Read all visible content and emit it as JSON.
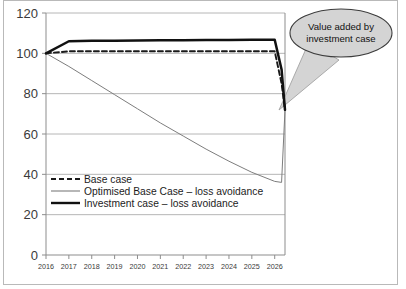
{
  "figure": {
    "frame_color": "#b9b9b9",
    "background": "#ffffff"
  },
  "callout": {
    "name": "value-added-callout",
    "line1": "Value added by",
    "line2": "investment case",
    "fill": "#d4d4d4",
    "stroke": "#3c3c3c"
  },
  "chart_data": {
    "type": "line",
    "title": "",
    "xlabel": "",
    "ylabel": "",
    "xlim": [
      2016,
      2026.45
    ],
    "ylim": [
      0,
      120
    ],
    "grid": true,
    "grid_axis": "y",
    "legend_position": "inside-lower-left",
    "x_tick_labels": [
      "2016",
      "2017",
      "2018",
      "2019",
      "2020",
      "2021",
      "2022",
      "2023",
      "2024",
      "2025",
      "2026"
    ],
    "y_tick_labels": [
      "0",
      "20",
      "40",
      "60",
      "80",
      "100",
      "120"
    ],
    "y_ticks": [
      0,
      20,
      40,
      60,
      80,
      100,
      120
    ],
    "x": [
      2016,
      2017,
      2018,
      2019,
      2020,
      2021,
      2022,
      2023,
      2024,
      2025,
      2026,
      2026.3,
      2026.45
    ],
    "series": [
      {
        "name": "Base case",
        "style": "dashed",
        "color": "#1a1a1a",
        "width": 1.9,
        "values": [
          100,
          101,
          101,
          101,
          101,
          101,
          101,
          101,
          101,
          101,
          101,
          85,
          72
        ]
      },
      {
        "name": "Optimised Base Case – loss avoidance",
        "style": "solid-thin",
        "color": "#7d7d7d",
        "width": 1.0,
        "values": [
          100,
          93.5,
          86.5,
          79.5,
          72.5,
          65.5,
          59,
          52.5,
          46.5,
          41,
          36.5,
          36,
          72
        ]
      },
      {
        "name": "Investment case – loss avoidance",
        "style": "solid-thick",
        "color": "#111111",
        "width": 2.5,
        "values": [
          100,
          106,
          106.2,
          106.3,
          106.4,
          106.5,
          106.5,
          106.6,
          106.6,
          106.7,
          106.7,
          92,
          72
        ]
      }
    ]
  }
}
